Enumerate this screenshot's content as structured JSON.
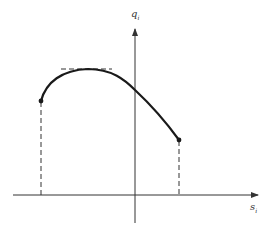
{
  "diagram": {
    "y_axis_label": "q",
    "y_axis_subscript": "i",
    "x_axis_label": "s",
    "x_axis_subscript": "i",
    "colors": {
      "curve": "#1a1a1a",
      "axis": "#333333",
      "dashed": "#333333",
      "background": "#ffffff"
    },
    "elements": [
      "horizontal axis with arrow (s_i)",
      "vertical axis with arrow (q_i)",
      "concave curve from left endpoint to right endpoint with a maximum",
      "horizontal dashed tangent at curve maximum",
      "vertical dashed lines from endpoints to horizontal axis",
      "filled dots at curve endpoints"
    ]
  }
}
